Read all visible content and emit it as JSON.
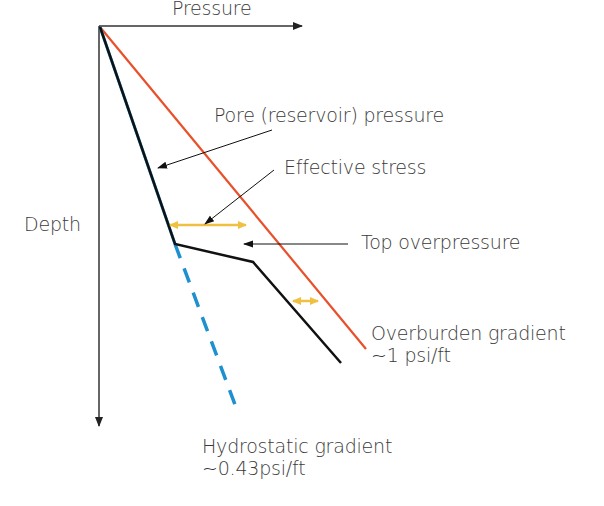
{
  "diagram": {
    "axes": {
      "x_label": "Pressure",
      "y_label": "Depth"
    },
    "labels": {
      "pore_pressure": "Pore (reservoir) pressure",
      "effective_stress": "Effective stress",
      "top_overpressure": "Top overpressure",
      "overburden_line1": "Overburden gradient",
      "overburden_line2": "~1 psi/ft",
      "hydrostatic_line1": "Hydrostatic gradient",
      "hydrostatic_line2": "~0.43psi/ft"
    },
    "colors": {
      "overburden": "#e8502a",
      "pore_pressure": "#111111",
      "hydrostatic": "#1e8fcf",
      "effective_stress_arrow": "#f0c040",
      "axis": "#333333"
    }
  }
}
